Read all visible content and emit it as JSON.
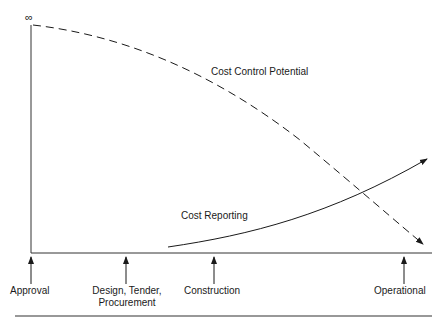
{
  "diagram": {
    "y_axis_symbol": "∞",
    "curves": [
      {
        "name": "Cost Control Potential",
        "style": "dashed",
        "direction": "decreasing"
      },
      {
        "name": "Cost Reporting",
        "style": "solid",
        "direction": "increasing"
      }
    ],
    "labels": {
      "cost_control": "Cost Control Potential",
      "cost_reporting": "Cost Reporting"
    },
    "milestones": [
      {
        "line1": "Approval",
        "line2": ""
      },
      {
        "line1": "Design, Tender,",
        "line2": "Procurement"
      },
      {
        "line1": "Construction",
        "line2": ""
      },
      {
        "line1": "Operational",
        "line2": ""
      }
    ]
  }
}
